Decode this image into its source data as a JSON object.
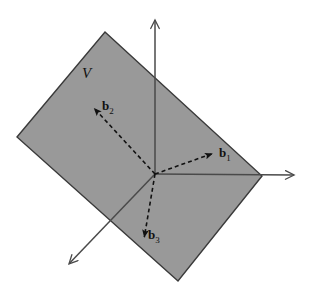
{
  "figure": {
    "name": "subspace-basis-vectors-diagram",
    "background_color": "#ffffff",
    "width": 310,
    "height": 291
  },
  "plane": {
    "label": "V",
    "fill_color": "#999999",
    "stroke_color": "#3a3a3a",
    "label_position": {
      "x": 82,
      "y": 66
    },
    "corners": [
      {
        "x": 105,
        "y": 32
      },
      {
        "x": 262,
        "y": 176
      },
      {
        "x": 178,
        "y": 281
      },
      {
        "x": 17,
        "y": 137
      }
    ]
  },
  "axes": {
    "stroke_color": "#4a4a4a",
    "origin": {
      "x": 155,
      "y": 174
    },
    "items": [
      {
        "name": "vertical-axis",
        "from": {
          "x": 155,
          "y": 174
        },
        "to": {
          "x": 155,
          "y": 17
        },
        "arrowhead": "open"
      },
      {
        "name": "horizontal-axis",
        "from": {
          "x": 155,
          "y": 174
        },
        "to": {
          "x": 297,
          "y": 175
        },
        "arrowhead": "open"
      },
      {
        "name": "depth-axis",
        "from": {
          "x": 155,
          "y": 174
        },
        "to": {
          "x": 67,
          "y": 266
        },
        "arrowhead": "open"
      }
    ]
  },
  "vectors": {
    "stroke_color": "#111111",
    "dash_pattern": "4 3",
    "items": [
      {
        "name": "basis-vector-b1",
        "label": "b",
        "subscript": "1",
        "from": {
          "x": 155,
          "y": 174
        },
        "to": {
          "x": 214,
          "y": 153
        },
        "label_position": {
          "x": 219,
          "y": 146
        }
      },
      {
        "name": "basis-vector-b2",
        "label": "b",
        "subscript": "2",
        "from": {
          "x": 155,
          "y": 174
        },
        "to": {
          "x": 93,
          "y": 107
        },
        "label_position": {
          "x": 102,
          "y": 99
        }
      },
      {
        "name": "basis-vector-b3",
        "label": "b",
        "subscript": "3",
        "from": {
          "x": 155,
          "y": 174
        },
        "to": {
          "x": 144,
          "y": 239
        },
        "label_position": {
          "x": 148,
          "y": 228
        }
      }
    ]
  }
}
